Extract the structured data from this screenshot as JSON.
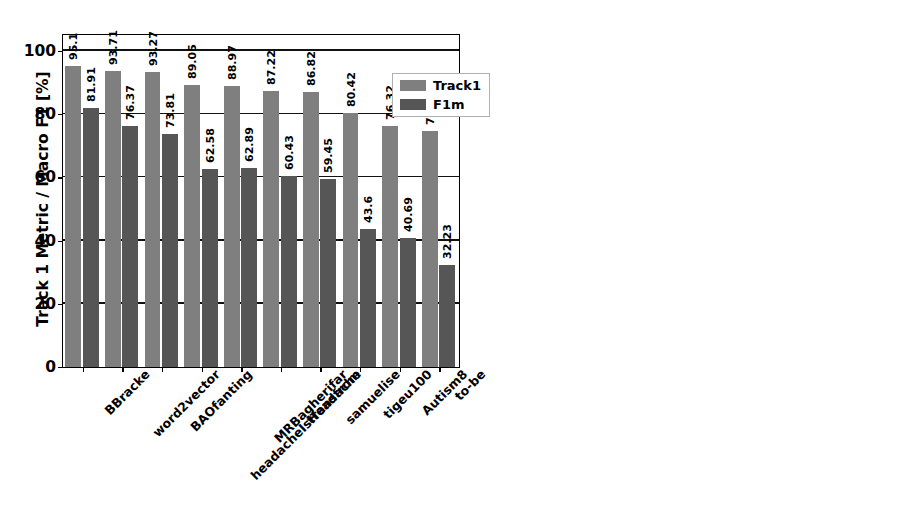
{
  "chart_data": [
    {
      "type": "bar",
      "title": "",
      "panel": "left",
      "xlabel": "",
      "ylabel": "Track 1 Metric / Macro F1 [%]",
      "ylim": [
        0,
        105
      ],
      "yticks": [
        0,
        20,
        40,
        60,
        80,
        100
      ],
      "ytick_labels": [
        "0",
        "20",
        "40",
        "60",
        "80",
        "100"
      ],
      "grid": true,
      "legend_position": "upper right",
      "categories": [
        "BBracke",
        "word2vector",
        "BAOfanting",
        "headacheIsHeadache",
        "MRBagherifar",
        "transfrom",
        "samuelise",
        "tigeu100",
        "Autism8",
        "to-be"
      ],
      "series": [
        {
          "name": "Track1",
          "color": "#7f7f7f",
          "values": [
            95.1,
            93.71,
            93.27,
            89.05,
            88.97,
            87.22,
            86.82,
            80.42,
            76.32,
            74.79
          ],
          "labels": [
            "95.1",
            "93.71",
            "93.27",
            "89.05",
            "88.97",
            "87.22",
            "86.82",
            "80.42",
            "76.32",
            "74.79"
          ]
        },
        {
          "name": "F1m",
          "color": "#565656",
          "values": [
            81.91,
            76.37,
            73.81,
            62.58,
            62.89,
            60.43,
            59.45,
            43.6,
            40.69,
            32.23
          ],
          "labels": [
            "81.91",
            "76.37",
            "73.81",
            "62.58",
            "62.89",
            "60.43",
            "59.45",
            "43.6",
            "40.69",
            "32.23"
          ]
        }
      ]
    },
    {
      "type": "bar",
      "title": "",
      "panel": "right",
      "xlabel": "",
      "ylabel": "Track 2 Metric",
      "ylim": [
        0,
        6600
      ],
      "yticks": [
        0,
        1000,
        2000,
        3000,
        4000,
        5000,
        6000
      ],
      "ytick_labels": [
        "0",
        "1000",
        "2000",
        "3000",
        "4000",
        "5000",
        "6000"
      ],
      "grid": true,
      "legend_position": "none",
      "categories": [
        "BBracke",
        "word2vector",
        "BAOfanting",
        "headacheIsHeadache",
        "MRBagherifar",
        "transfrom",
        "samuelise",
        "tigeu100",
        "Autism8",
        "to-be"
      ],
      "series": [
        {
          "name": "Track 2 Metric",
          "color": "#2b2b2b",
          "values": [
            1146,
            1553,
            1485,
            2487,
            2481,
            2957,
            2975,
            4573,
            5539,
            6013
          ],
          "labels": [
            "1146",
            "1553",
            "1485",
            "2487",
            "2481",
            "2957",
            "2975",
            "4573",
            "5539",
            "6013"
          ]
        }
      ]
    }
  ],
  "legend": {
    "items": [
      {
        "label": "Track1",
        "swatch": "light"
      },
      {
        "label": "F1m",
        "swatch": "dark"
      }
    ]
  }
}
